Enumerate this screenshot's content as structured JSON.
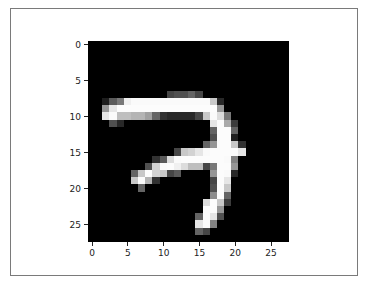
{
  "chart_data": {
    "type": "heatmap",
    "title": "",
    "xlabel": "",
    "ylabel": "",
    "colormap": "gray",
    "xlim": [
      -0.5,
      27.5
    ],
    "ylim": [
      27.5,
      -0.5
    ],
    "grid": false,
    "legend": null,
    "x_ticks": [
      0,
      5,
      10,
      15,
      20,
      25
    ],
    "y_ticks": [
      0,
      5,
      10,
      15,
      20,
      25
    ],
    "x_tick_labels": [
      "0",
      "5",
      "10",
      "15",
      "20",
      "25"
    ],
    "y_tick_labels": [
      "0",
      "5",
      "10",
      "15",
      "20",
      "25"
    ],
    "shape": [
      28,
      28
    ],
    "nonzero_pixels": {
      "7": {
        "11": 70,
        "12": 80,
        "13": 80,
        "14": 100,
        "15": 70
      },
      "8": {
        "2": 30,
        "3": 90,
        "4": 120,
        "5": 240,
        "6": 250,
        "7": 250,
        "8": 250,
        "9": 250,
        "10": 250,
        "11": 250,
        "12": 250,
        "13": 250,
        "14": 250,
        "15": 250,
        "16": 250,
        "17": 200,
        "18": 40
      },
      "9": {
        "2": 150,
        "3": 230,
        "4": 252,
        "5": 252,
        "6": 252,
        "7": 252,
        "8": 252,
        "9": 252,
        "10": 252,
        "11": 252,
        "12": 252,
        "13": 252,
        "14": 252,
        "15": 252,
        "16": 252,
        "17": 252,
        "18": 150
      },
      "10": {
        "2": 230,
        "3": 250,
        "4": 190,
        "5": 190,
        "6": 180,
        "7": 180,
        "8": 160,
        "9": 100,
        "10": 50,
        "11": 40,
        "12": 40,
        "13": 40,
        "14": 40,
        "15": 70,
        "16": 200,
        "17": 250,
        "18": 220,
        "19": 120
      },
      "11": {
        "3": 80,
        "4": 40,
        "17": 230,
        "18": 252,
        "19": 170,
        "20": 60
      },
      "12": {
        "17": 100,
        "18": 252,
        "19": 252,
        "20": 100
      },
      "13": {
        "17": 80,
        "18": 252,
        "19": 252,
        "20": 30
      },
      "14": {
        "16": 100,
        "17": 150,
        "18": 252,
        "19": 252,
        "20": 200,
        "21": 50
      },
      "15": {
        "12": 70,
        "13": 200,
        "14": 210,
        "15": 230,
        "16": 250,
        "17": 252,
        "18": 252,
        "19": 252,
        "20": 252,
        "21": 230
      },
      "16": {
        "9": 50,
        "10": 90,
        "11": 220,
        "12": 250,
        "13": 252,
        "14": 252,
        "15": 252,
        "16": 252,
        "17": 252,
        "18": 252,
        "19": 250,
        "20": 130
      },
      "17": {
        "8": 80,
        "9": 210,
        "10": 250,
        "11": 252,
        "12": 240,
        "13": 220,
        "14": 190,
        "15": 190,
        "16": 70,
        "17": 120,
        "18": 252,
        "19": 252,
        "20": 150
      },
      "18": {
        "6": 100,
        "7": 200,
        "8": 252,
        "9": 210,
        "10": 200,
        "11": 70,
        "12": 90,
        "17": 150,
        "18": 252,
        "19": 250,
        "20": 40
      },
      "19": {
        "6": 200,
        "7": 252,
        "8": 180,
        "9": 50,
        "17": 70,
        "18": 252,
        "19": 230
      },
      "20": {
        "7": 100,
        "17": 80,
        "18": 252,
        "19": 200
      },
      "21": {
        "17": 140,
        "18": 252,
        "19": 100
      },
      "22": {
        "16": 220,
        "17": 252,
        "18": 200,
        "19": 60
      },
      "23": {
        "16": 252,
        "17": 252,
        "18": 150
      },
      "24": {
        "15": 100,
        "16": 252,
        "17": 230,
        "18": 80
      },
      "25": {
        "15": 230,
        "16": 252,
        "17": 130
      },
      "26": {
        "15": 100,
        "16": 70
      }
    }
  },
  "axes": {
    "x_ticks": [
      {
        "label": "0",
        "x": 91.6
      },
      {
        "label": "5",
        "x": 127.4
      },
      {
        "label": "10",
        "x": 163.2
      },
      {
        "label": "15",
        "x": 199.0
      },
      {
        "label": "20",
        "x": 234.8
      },
      {
        "label": "25",
        "x": 270.6
      }
    ],
    "y_ticks": [
      {
        "label": "0",
        "y": 44.1
      },
      {
        "label": "5",
        "y": 80.1
      },
      {
        "label": "10",
        "y": 116.1
      },
      {
        "label": "15",
        "y": 152.1
      },
      {
        "label": "20",
        "y": 188.1
      },
      {
        "label": "25",
        "y": 224.1
      }
    ]
  }
}
